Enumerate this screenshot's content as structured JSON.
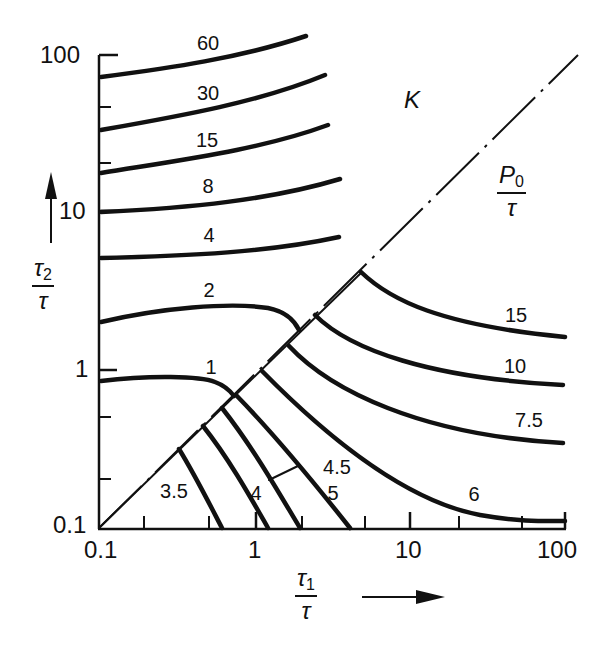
{
  "chart_data": {
    "type": "line",
    "title": "",
    "xlabel": "τ1/τ",
    "ylabel": "τ2/τ",
    "xscale": "log",
    "yscale": "log",
    "xlim": [
      0.1,
      100
    ],
    "ylim": [
      0.1,
      100
    ],
    "x_ticks": [
      "0.1",
      "1",
      "10",
      "100"
    ],
    "y_ticks": [
      "0.1",
      "1",
      "10",
      "100"
    ],
    "grid": false,
    "legend": "none",
    "regions": [
      {
        "label": "K",
        "description": "upper-left region above diagonal τ1 = τ2"
      },
      {
        "label": "P0/τ",
        "description": "lower-right region below diagonal τ1 = τ2"
      }
    ],
    "diagonal": {
      "style": "dash-dot",
      "from": [
        0.1,
        0.1
      ],
      "to": [
        100,
        100
      ]
    },
    "series": [
      {
        "name": "60",
        "region": "K",
        "points": [
          [
            0.1,
            70
          ],
          [
            0.6,
            90
          ],
          [
            3.2,
            140
          ]
        ]
      },
      {
        "name": "30",
        "region": "K",
        "points": [
          [
            0.1,
            33
          ],
          [
            0.8,
            45
          ],
          [
            4.0,
            70
          ]
        ]
      },
      {
        "name": "15",
        "region": "K",
        "points": [
          [
            0.1,
            17
          ],
          [
            0.8,
            22
          ],
          [
            4.2,
            34
          ]
        ]
      },
      {
        "name": "8",
        "region": "K",
        "points": [
          [
            0.1,
            10
          ],
          [
            0.8,
            11
          ],
          [
            5.0,
            16
          ]
        ]
      },
      {
        "name": "4",
        "region": "K",
        "points": [
          [
            0.1,
            5
          ],
          [
            0.8,
            5.3
          ],
          [
            5.0,
            7
          ]
        ]
      },
      {
        "name": "2",
        "region": "K",
        "points": [
          [
            0.1,
            2.0
          ],
          [
            0.5,
            2.4
          ],
          [
            1.3,
            2.5
          ],
          [
            1.9,
            1.9
          ]
        ]
      },
      {
        "name": "1",
        "region": "K",
        "points": [
          [
            0.1,
            0.85
          ],
          [
            0.4,
            0.85
          ],
          [
            0.7,
            0.75
          ]
        ]
      },
      {
        "name": "15",
        "region": "P0/τ",
        "points": [
          [
            4.8,
            4.8
          ],
          [
            12,
            2.5
          ],
          [
            90,
            1.6
          ]
        ]
      },
      {
        "name": "10",
        "region": "P0/τ",
        "points": [
          [
            2.4,
            2.4
          ],
          [
            8,
            1.2
          ],
          [
            90,
            0.8
          ]
        ]
      },
      {
        "name": "7.5",
        "region": "P0/τ",
        "points": [
          [
            1.8,
            1.8
          ],
          [
            8,
            0.6
          ],
          [
            90,
            0.34
          ]
        ]
      },
      {
        "name": "6",
        "region": "P0/τ",
        "points": [
          [
            1.2,
            1.2
          ],
          [
            10,
            0.22
          ],
          [
            100,
            0.105
          ]
        ]
      },
      {
        "name": "5",
        "region": "P0/τ",
        "points": [
          [
            0.85,
            0.85
          ],
          [
            4.2,
            0.1
          ]
        ]
      },
      {
        "name": "4.5",
        "region": "P0/τ",
        "points": [
          [
            0.6,
            0.6
          ],
          [
            2.0,
            0.1
          ]
        ]
      },
      {
        "name": "4",
        "region": "P0/τ",
        "points": [
          [
            0.48,
            0.48
          ],
          [
            1.2,
            0.1
          ]
        ]
      },
      {
        "name": "3.5",
        "region": "P0/τ",
        "points": [
          [
            0.34,
            0.34
          ],
          [
            0.8,
            0.1
          ]
        ]
      }
    ]
  },
  "axes": {
    "x_tick_labels": [
      {
        "text": "0.1",
        "x": 84,
        "y": 538
      },
      {
        "text": "1",
        "x": 248,
        "y": 538
      },
      {
        "text": "10",
        "x": 395,
        "y": 538
      },
      {
        "text": "100",
        "x": 537,
        "y": 538
      }
    ],
    "y_tick_labels": [
      {
        "text": "100",
        "x": 40,
        "y": 43
      },
      {
        "text": "10",
        "x": 59,
        "y": 199
      },
      {
        "text": "1",
        "x": 75,
        "y": 357
      },
      {
        "text": "0.1",
        "x": 53,
        "y": 513
      }
    ],
    "x_label": {
      "num": "τ",
      "sub": "1",
      "den": "τ"
    },
    "y_label": {
      "num": "τ",
      "sub": "2",
      "den": "τ"
    },
    "p0_label": {
      "num": "P",
      "sub": "0",
      "den": "τ"
    },
    "k_label": "K"
  },
  "curve_labels": [
    {
      "text": "60",
      "x": 208,
      "y": 43
    },
    {
      "text": "30",
      "x": 208,
      "y": 93
    },
    {
      "text": "15",
      "x": 207,
      "y": 140
    },
    {
      "text": "8",
      "x": 208,
      "y": 186
    },
    {
      "text": "4",
      "x": 209,
      "y": 235
    },
    {
      "text": "2",
      "x": 209,
      "y": 290
    },
    {
      "text": "1",
      "x": 211,
      "y": 367
    },
    {
      "text": "15",
      "x": 516,
      "y": 315
    },
    {
      "text": "10",
      "x": 515,
      "y": 366
    },
    {
      "text": "7.5",
      "x": 529,
      "y": 420
    },
    {
      "text": "6",
      "x": 474,
      "y": 494
    },
    {
      "text": "5",
      "x": 333,
      "y": 493
    },
    {
      "text": "4.5",
      "x": 337,
      "y": 467
    },
    {
      "text": "4",
      "x": 256,
      "y": 493
    },
    {
      "text": "3.5",
      "x": 174,
      "y": 491
    }
  ],
  "colors": {
    "ink": "#111111",
    "background": "#ffffff"
  }
}
